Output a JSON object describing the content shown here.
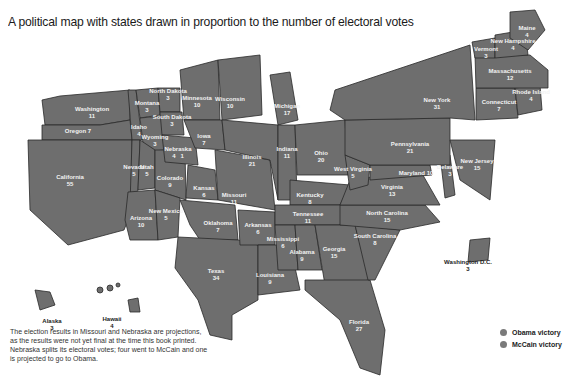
{
  "title": "A political map with states drawn in proportion to the number of electoral votes",
  "colors": {
    "state_fill": "#6e6e6e",
    "border": "#2a2a2a",
    "label": "#f2f2f2",
    "obama": "#7a7a7a",
    "mccain": "#7a7a7a"
  },
  "states": [
    {
      "name": "Washington",
      "votes": "11"
    },
    {
      "name": "Oregon",
      "votes": "7"
    },
    {
      "name": "California",
      "votes": "55"
    },
    {
      "name": "Idaho",
      "votes": "4"
    },
    {
      "name": "Nevada",
      "votes": "5"
    },
    {
      "name": "Montana",
      "votes": "3"
    },
    {
      "name": "Wyoming",
      "votes": "3"
    },
    {
      "name": "Utah",
      "votes": "5"
    },
    {
      "name": "Arizona",
      "votes": "10"
    },
    {
      "name": "Colorado",
      "votes": "9"
    },
    {
      "name": "New Mexico",
      "votes": "5"
    },
    {
      "name": "North Dakota",
      "votes": "3"
    },
    {
      "name": "South Dakota",
      "votes": "3"
    },
    {
      "name": "Nebraska",
      "votes": "4",
      "votes_split": "1"
    },
    {
      "name": "Kansas",
      "votes": "6"
    },
    {
      "name": "Oklahoma",
      "votes": "7"
    },
    {
      "name": "Texas",
      "votes": "34"
    },
    {
      "name": "Minnesota",
      "votes": "10"
    },
    {
      "name": "Iowa",
      "votes": "7"
    },
    {
      "name": "Missouri",
      "votes": "11"
    },
    {
      "name": "Arkansas",
      "votes": "6"
    },
    {
      "name": "Louisiana",
      "votes": "9"
    },
    {
      "name": "Wisconsin",
      "votes": "10"
    },
    {
      "name": "Illinois",
      "votes": "21"
    },
    {
      "name": "Michigan",
      "votes": "17"
    },
    {
      "name": "Indiana",
      "votes": "11"
    },
    {
      "name": "Ohio",
      "votes": "20"
    },
    {
      "name": "Kentucky",
      "votes": "8"
    },
    {
      "name": "Tennessee",
      "votes": "11"
    },
    {
      "name": "Mississippi",
      "votes": "6"
    },
    {
      "name": "Alabama",
      "votes": "9"
    },
    {
      "name": "Georgia",
      "votes": "15"
    },
    {
      "name": "Florida",
      "votes": "27"
    },
    {
      "name": "South Carolina",
      "votes": "8"
    },
    {
      "name": "North Carolina",
      "votes": "15"
    },
    {
      "name": "Virginia",
      "votes": "13"
    },
    {
      "name": "West Virginia",
      "votes": "5"
    },
    {
      "name": "Maryland",
      "votes": "10"
    },
    {
      "name": "Delaware",
      "votes": "3"
    },
    {
      "name": "Pennsylvania",
      "votes": "21"
    },
    {
      "name": "New Jersey",
      "votes": "15"
    },
    {
      "name": "New York",
      "votes": "31"
    },
    {
      "name": "Connecticut",
      "votes": "7"
    },
    {
      "name": "Rhode Island",
      "votes": "4"
    },
    {
      "name": "Massachusetts",
      "votes": "12"
    },
    {
      "name": "Vermont",
      "votes": "3"
    },
    {
      "name": "New Hampshire",
      "votes": "4"
    },
    {
      "name": "Maine",
      "votes": "4"
    },
    {
      "name": "Alaska",
      "votes": "3"
    },
    {
      "name": "Hawaii",
      "votes": "4"
    },
    {
      "name": "Washington D.C.",
      "votes": "3"
    }
  ],
  "note": "The election results in Missouri and Nebraska are projections, as the results were not yet final at the time this book printed. Nebraska splits its electoral votes; four went to McCain and one is projected to go to Obama.",
  "legend": [
    {
      "label": "Obama victory",
      "color": "#7a7a7a"
    },
    {
      "label": "McCain victory",
      "color": "#7a7a7a"
    }
  ]
}
